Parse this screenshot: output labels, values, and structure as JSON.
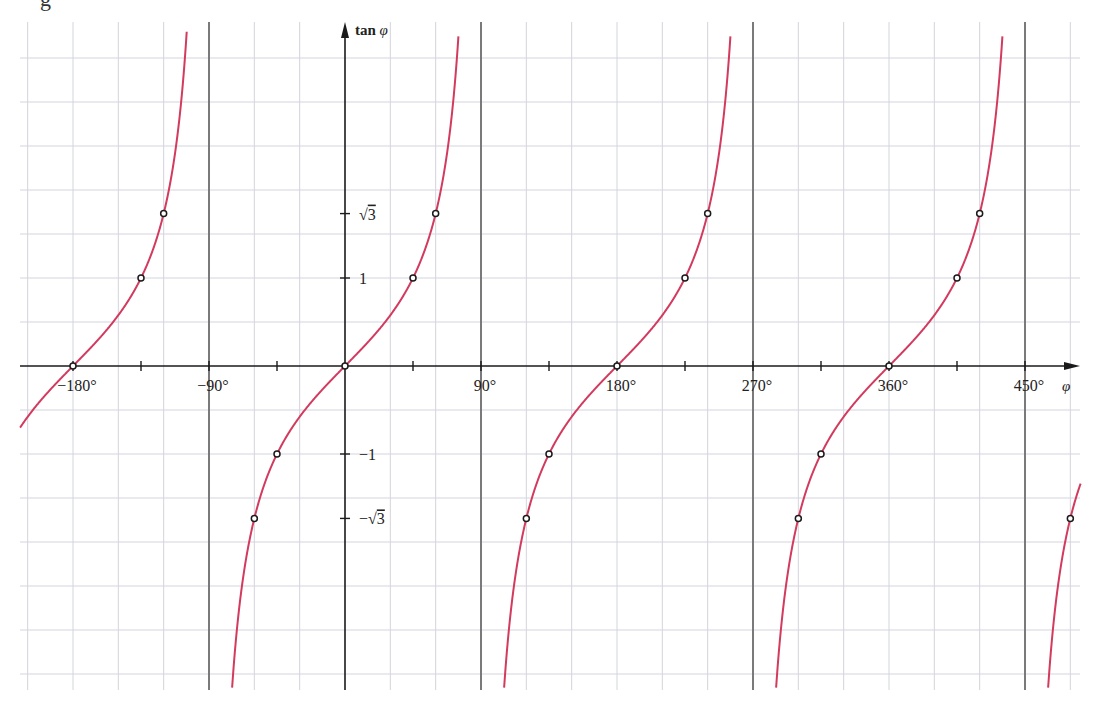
{
  "header": {
    "fragment_text": "g"
  },
  "chart_data": {
    "type": "line",
    "title": "",
    "function": "tan(φ)",
    "xlabel": "φ",
    "ylabel": "tan φ",
    "xlim": [
      -215,
      487
    ],
    "ylim": [
      -3.67,
      3.87
    ],
    "grid": true,
    "grid_x_step_deg": 30,
    "grid_y_step": 0.5,
    "asymptotes_deg": [
      -90,
      90,
      270,
      450
    ],
    "x_ticks_deg": [
      -180,
      -135,
      -90,
      -45,
      45,
      90,
      135,
      180,
      225,
      270,
      315,
      360,
      405,
      450
    ],
    "x_tick_labels": [
      {
        "value": -180,
        "label": "−180°"
      },
      {
        "value": -90,
        "label": "−90°"
      },
      {
        "value": 90,
        "label": "90°"
      },
      {
        "value": 180,
        "label": "180°"
      },
      {
        "value": 270,
        "label": "270°"
      },
      {
        "value": 360,
        "label": "360°"
      },
      {
        "value": 450,
        "label": "450°"
      }
    ],
    "y_tick_labels": [
      {
        "value": 1.7320508,
        "label": "√3"
      },
      {
        "value": 1,
        "label": "1"
      },
      {
        "value": -1,
        "label": "−1"
      },
      {
        "value": -1.7320508,
        "label": "−√3"
      }
    ],
    "series": [
      {
        "name": "tan φ",
        "color": "#d23a5e",
        "branches": [
          [
            -215,
            -104.6
          ],
          [
            -75.2,
            75.2
          ],
          [
            104.8,
            255.2
          ],
          [
            284.8,
            435.2
          ],
          [
            464.8,
            487
          ]
        ]
      }
    ],
    "marked_points": [
      {
        "x": -180,
        "y": 0
      },
      {
        "x": -135,
        "y": 1
      },
      {
        "x": -120,
        "y": 1.7320508
      },
      {
        "x": -60,
        "y": -1.7320508
      },
      {
        "x": -45,
        "y": -1
      },
      {
        "x": 0,
        "y": 0
      },
      {
        "x": 45,
        "y": 1
      },
      {
        "x": 60,
        "y": 1.7320508
      },
      {
        "x": 120,
        "y": -1.7320508
      },
      {
        "x": 135,
        "y": -1
      },
      {
        "x": 180,
        "y": 0
      },
      {
        "x": 225,
        "y": 1
      },
      {
        "x": 240,
        "y": 1.7320508
      },
      {
        "x": 300,
        "y": -1.7320508
      },
      {
        "x": 315,
        "y": -1
      },
      {
        "x": 360,
        "y": 0
      },
      {
        "x": 405,
        "y": 1
      },
      {
        "x": 420,
        "y": 1.7320508
      },
      {
        "x": 480,
        "y": -1.7320508
      }
    ],
    "layout": {
      "origin_px": [
        345,
        366
      ],
      "px_per_90deg": 136,
      "px_per_unit": 88,
      "plot_left": 20,
      "plot_right": 1080,
      "plot_top": 22,
      "plot_bottom": 690
    }
  }
}
